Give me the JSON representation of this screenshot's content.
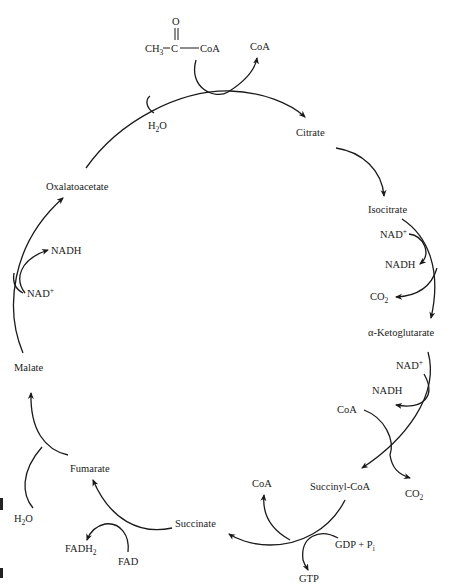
{
  "diagram": {
    "acetyl_coa": {
      "carbonyl_o": "O",
      "methyl": "CH",
      "methyl_sub": "3",
      "carbon": "C",
      "coa": "CoA"
    },
    "intermediates": {
      "citrate": "Citrate",
      "isocitrate": "Isocitrate",
      "alpha_ketoglutarate": "α-Ketoglutarate",
      "succinyl_coa": "Succinyl-CoA",
      "succinate": "Succinate",
      "fumarate": "Fumarate",
      "malate": "Malate",
      "oxaloacetate": "Oxalatoacetate"
    },
    "cofactors": {
      "coa_out_top": "CoA",
      "water_top": {
        "base": "H",
        "sub": "2",
        "tail": "O"
      },
      "isocitrate_nad": {
        "base": "NAD",
        "sup": "+"
      },
      "isocitrate_nadh": "NADH",
      "isocitrate_co2": {
        "base": "CO",
        "sub": "2"
      },
      "akg_nad": {
        "base": "NAD",
        "sup": "+"
      },
      "akg_nadh": "NADH",
      "akg_coa": "CoA",
      "akg_co2": {
        "base": "CO",
        "sub": "2"
      },
      "sc_coa": "CoA",
      "sc_gdp": {
        "base": "GDP + P",
        "sub": "i"
      },
      "sc_gtp": "GTP",
      "succ_fad": "FAD",
      "succ_fadh2": {
        "base": "FADH",
        "sub": "2"
      },
      "fum_water": {
        "base": "H",
        "sub": "2",
        "tail": "O"
      },
      "mal_nad": {
        "base": "NAD",
        "sup": "+"
      },
      "mal_nadh": "NADH"
    }
  }
}
